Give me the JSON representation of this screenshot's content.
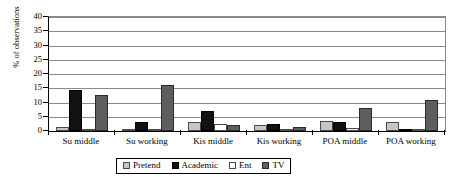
{
  "chart_data": {
    "type": "bar",
    "title": "",
    "xlabel": "",
    "ylabel": "% of observations",
    "ylim": [
      0,
      40
    ],
    "ytick_step": 5,
    "yticks": [
      40,
      35,
      30,
      25,
      20,
      15,
      10,
      5,
      0
    ],
    "grid": true,
    "legend_position": "bottom",
    "categories": [
      "Su middle",
      "Su working",
      "Kis middle",
      "Kis working",
      "POA middle",
      "POA working"
    ],
    "series": [
      {
        "name": "Pretend",
        "color": "#c6c6c6",
        "values": [
          1.5,
          0.3,
          3.0,
          2.0,
          3.5,
          3.0
        ]
      },
      {
        "name": "Academic",
        "color": "#111111",
        "values": [
          14.5,
          3.0,
          7.0,
          2.5,
          3.0,
          0.8
        ]
      },
      {
        "name": "Ent",
        "color": "#ffffff",
        "values": [
          0.5,
          0.5,
          2.5,
          0.5,
          1.0,
          0.5
        ]
      },
      {
        "name": "TV",
        "color": "#5e5e5e",
        "values": [
          12.5,
          16.0,
          2.0,
          1.5,
          8.0,
          11.0
        ]
      }
    ]
  }
}
